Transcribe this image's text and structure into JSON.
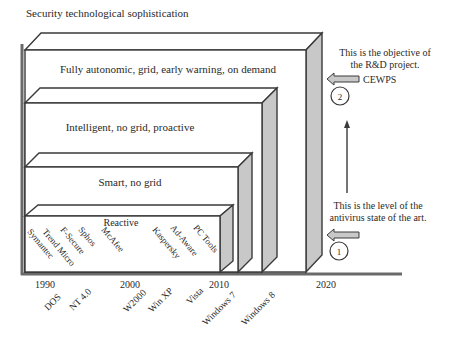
{
  "title": "Security technological sophistication",
  "levels": [
    {
      "label": "Fully autonomic, grid, early warning, on demand",
      "end_year": "2020"
    },
    {
      "label": "Intelligent, no grid, proactive",
      "end_year": "Windows 8"
    },
    {
      "label": "Smart, no grid",
      "end_year": "Windows 7"
    },
    {
      "label": "Reactive",
      "end_year": "2010"
    }
  ],
  "vendors": [
    "Symantec",
    "Trend Micro",
    "F-Secure",
    "Sphos",
    "McAfee",
    "Kaspersky",
    "Ad-Aware",
    "PC Tools"
  ],
  "years": [
    "1990",
    "2000",
    "2010",
    "2020"
  ],
  "os_labels": [
    "DOS",
    "NT 4.0",
    "W2000",
    "Win XP",
    "Vista",
    "Windows 7",
    "Windows 8"
  ],
  "annotations": {
    "objective_line1": "This is the objective of",
    "objective_line2": "the R&D project.",
    "cewps": "CEWPS",
    "marker2": "2",
    "state_line1": "This is the level of the",
    "state_line2": "antivirus state of the art.",
    "marker1": "1"
  },
  "colors": {
    "line": "#3a3a3a",
    "side_fill": "#c8c8c8",
    "arrow_fill": "#c8c8c8",
    "axis": "#6a6a6a"
  }
}
